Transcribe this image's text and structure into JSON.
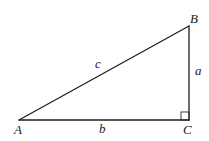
{
  "diagram": {
    "type": "right-triangle",
    "colors": {
      "stroke": "#1f1f1f",
      "text": "#1a1a1a",
      "background": "#ffffff"
    },
    "vertices": [
      {
        "id": "A",
        "label": "A",
        "x": 19,
        "y": 120
      },
      {
        "id": "B",
        "label": "B",
        "x": 189,
        "y": 26
      },
      {
        "id": "C",
        "label": "C",
        "x": 189,
        "y": 120
      }
    ],
    "sides": [
      {
        "id": "a",
        "label": "a",
        "from": "B",
        "to": "C"
      },
      {
        "id": "b",
        "label": "b",
        "from": "A",
        "to": "C"
      },
      {
        "id": "c",
        "label": "c",
        "from": "A",
        "to": "B"
      }
    ],
    "right_angle_at": "C",
    "labels": {
      "vertex_A": "A",
      "vertex_B": "B",
      "vertex_C": "C",
      "side_a": "a",
      "side_b": "b",
      "side_c": "c"
    }
  }
}
